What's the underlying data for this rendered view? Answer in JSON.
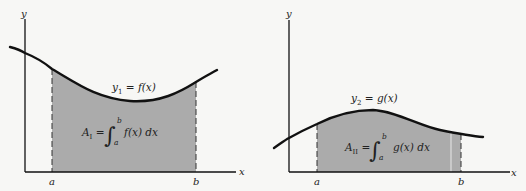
{
  "panels": [
    {
      "id": "left",
      "axis_y_label": "y",
      "axis_x_label": "x",
      "tick_a": "a",
      "tick_b": "b",
      "curve_label": {
        "var": "y",
        "sub": "1",
        "rhs": " = f(x)"
      },
      "area_label": {
        "var": "A",
        "sub": "I",
        "eq": " = ",
        "upper": "b",
        "lower": "a",
        "integrand": "f(x) dx"
      }
    },
    {
      "id": "right",
      "axis_y_label": "y",
      "axis_x_label": "x",
      "tick_a": "a",
      "tick_b": "b",
      "curve_label": {
        "var": "y",
        "sub": "2",
        "rhs": " = g(x)"
      },
      "area_label": {
        "var": "A",
        "sub": "II",
        "eq": " = ",
        "upper": "b",
        "lower": "a",
        "integrand": "g(x) dx"
      }
    }
  ],
  "colors": {
    "background": "#f7f7f5",
    "shade": "#ababab",
    "line": "#111111"
  }
}
